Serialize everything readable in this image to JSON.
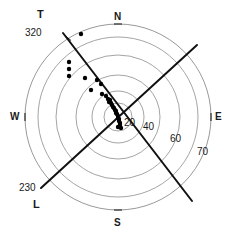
{
  "figure": {
    "title": "",
    "type": "polar-stereonet-scatter"
  },
  "cardinals": [
    {
      "name": "north",
      "label": "N",
      "x": 114,
      "y": 12
    },
    {
      "name": "east",
      "label": "E",
      "x": 215,
      "y": 112
    },
    {
      "name": "south",
      "label": "S",
      "x": 114,
      "y": 218
    },
    {
      "name": "west",
      "label": "W",
      "x": 10,
      "y": 112
    }
  ],
  "axis_labels": [
    {
      "name": "tick-20",
      "label": "20",
      "x": 124,
      "y": 118
    },
    {
      "name": "tick-40",
      "label": "40",
      "x": 143,
      "y": 122
    },
    {
      "name": "tick-60",
      "label": "60",
      "x": 170,
      "y": 134
    },
    {
      "name": "tick-70",
      "label": "70",
      "x": 197,
      "y": 147
    }
  ],
  "end_labels": [
    {
      "name": "t-axis-letter",
      "label": "T",
      "x": 37,
      "y": 9
    },
    {
      "name": "t-axis-bearing",
      "label": "320",
      "x": 25,
      "y": 28
    },
    {
      "name": "l-axis-bearing",
      "label": "230",
      "x": 19,
      "y": 183
    },
    {
      "name": "l-axis-letter",
      "label": "L",
      "x": 33,
      "y": 199
    }
  ],
  "chart_data": {
    "type": "scatter",
    "projection": "polar-equal-area",
    "title": "",
    "xlabel": "",
    "ylabel": "",
    "center": {
      "x": 118,
      "y": 117
    },
    "outer_radius": 93,
    "grid": true,
    "legend": null,
    "radial_ticks": [
      20,
      40,
      60,
      70
    ],
    "radial_circle_radii_px": [
      14,
      26,
      42,
      62,
      80,
      93
    ],
    "azimuth_ticks": [
      {
        "label": "N",
        "deg": 0
      },
      {
        "label": "E",
        "deg": 90
      },
      {
        "label": "S",
        "deg": 180
      },
      {
        "label": "W",
        "deg": 270
      }
    ],
    "lines": [
      {
        "name": "t-axis",
        "label": "T",
        "bearing_deg": 320,
        "stroke": "#111111",
        "width": 2,
        "x1": 63,
        "y1": 33,
        "x2": 192,
        "y2": 201
      },
      {
        "name": "l-axis",
        "label": "L",
        "bearing_deg": 230,
        "stroke": "#111111",
        "width": 2,
        "x1": 41,
        "y1": 188,
        "x2": 197,
        "y2": 45
      }
    ],
    "tick_marks": [
      {
        "name": "t-axis-tick",
        "x": 68,
        "y": 38,
        "angle_deg": 40
      },
      {
        "name": "north-tick",
        "x": 118,
        "y": 24,
        "angle_deg": 0
      },
      {
        "name": "east-tick",
        "x": 211,
        "y": 117,
        "angle_deg": 90
      },
      {
        "name": "south-tick",
        "x": 118,
        "y": 210,
        "angle_deg": 0
      },
      {
        "name": "west-tick",
        "x": 25,
        "y": 117,
        "angle_deg": 90
      }
    ],
    "points": [
      {
        "x": 81,
        "y": 34
      },
      {
        "x": 69,
        "y": 62
      },
      {
        "x": 69,
        "y": 69
      },
      {
        "x": 69,
        "y": 76
      },
      {
        "x": 85,
        "y": 78
      },
      {
        "x": 97,
        "y": 80
      },
      {
        "x": 101,
        "y": 84
      },
      {
        "x": 91,
        "y": 90
      },
      {
        "x": 102,
        "y": 94
      },
      {
        "x": 106,
        "y": 96
      },
      {
        "x": 108,
        "y": 99
      },
      {
        "x": 110,
        "y": 100
      },
      {
        "x": 109,
        "y": 102
      },
      {
        "x": 111,
        "y": 103
      },
      {
        "x": 112,
        "y": 105
      },
      {
        "x": 113,
        "y": 107
      },
      {
        "x": 114,
        "y": 108
      },
      {
        "x": 115,
        "y": 110
      },
      {
        "x": 116,
        "y": 111
      },
      {
        "x": 116,
        "y": 113
      },
      {
        "x": 117,
        "y": 114
      },
      {
        "x": 118,
        "y": 116
      },
      {
        "x": 118,
        "y": 118
      },
      {
        "x": 119,
        "y": 119
      },
      {
        "x": 119,
        "y": 121
      },
      {
        "x": 120,
        "y": 123
      },
      {
        "x": 120,
        "y": 125
      },
      {
        "x": 118,
        "y": 127
      },
      {
        "x": 121,
        "y": 128
      }
    ],
    "point_color": "#000000",
    "point_size_px": 2.2
  },
  "colors": {
    "background": "#ffffff",
    "grid": "#8d8d8d",
    "axis_line": "#111111",
    "text": "#1a1a1a",
    "point": "#000000"
  }
}
